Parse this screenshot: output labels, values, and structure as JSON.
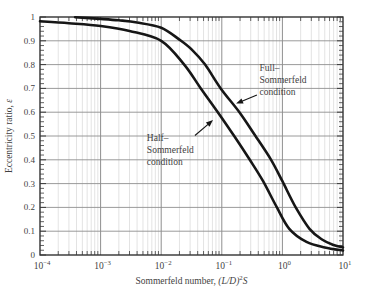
{
  "figure": {
    "background": "#ffffff",
    "frame_color": "#222222",
    "major_grid_color": "#8f8f8f",
    "minor_grid_color": "#c6c6c6",
    "tick_color": "#3a3a3a",
    "curve_color": "#161616",
    "text_color": "#3f3f3f"
  },
  "chart_data": {
    "type": "line",
    "title": "",
    "x_scale": "log",
    "xlim": [
      0.0001,
      10
    ],
    "ylim": [
      0,
      1
    ],
    "grid": {
      "vertical_minor": true,
      "vertical_major": true,
      "horizontal_major": true
    },
    "xlabel": {
      "prefix": "Sommerfeld number, ",
      "math": "(L/D)",
      "sup": "2",
      "suffix": "S"
    },
    "ylabel": {
      "prefix": "Eccentricity ratio, ",
      "math": "ε"
    },
    "x_ticks": [
      {
        "base": "10",
        "exp": "−4",
        "value": 0.0001
      },
      {
        "base": "10",
        "exp": "−3",
        "value": 0.001
      },
      {
        "base": "10",
        "exp": "−2",
        "value": 0.01
      },
      {
        "base": "10",
        "exp": "−1",
        "value": 0.1
      },
      {
        "base": "10",
        "exp": "0",
        "value": 1
      },
      {
        "base": "10",
        "exp": "1",
        "value": 10
      }
    ],
    "y_ticks": [
      {
        "label": "1",
        "value": 1.0
      },
      {
        "label": "0.9",
        "value": 0.9
      },
      {
        "label": "0.8",
        "value": 0.8
      },
      {
        "label": "0.7",
        "value": 0.7
      },
      {
        "label": "0.6",
        "value": 0.6
      },
      {
        "label": "0.5",
        "value": 0.5
      },
      {
        "label": "0.4",
        "value": 0.4
      },
      {
        "label": "0.3",
        "value": 0.3
      },
      {
        "label": "0.2",
        "value": 0.2
      },
      {
        "label": "0.1",
        "value": 0.1
      },
      {
        "label": "0",
        "value": 0.0
      }
    ],
    "y_minor_step": 0.02,
    "series": [
      {
        "name": "Full–Sommerfeld condition",
        "x": [
          0.00038,
          0.001,
          0.002,
          0.004,
          0.01,
          0.02,
          0.032,
          0.053,
          0.096,
          0.195,
          0.36,
          0.65,
          1.0,
          1.66,
          2.8,
          4.5,
          7.0,
          10.0
        ],
        "y": [
          0.999,
          0.992,
          0.986,
          0.977,
          0.955,
          0.905,
          0.863,
          0.8,
          0.7,
          0.6,
          0.5,
          0.4,
          0.31,
          0.2,
          0.11,
          0.065,
          0.042,
          0.032
        ]
      },
      {
        "name": "Half–Sommerfeld condition",
        "x": [
          0.0001,
          0.0003,
          0.001,
          0.003,
          0.01,
          0.024,
          0.045,
          0.086,
          0.16,
          0.29,
          0.48,
          0.81,
          1.3,
          2.5,
          5.0,
          10.0
        ],
        "y": [
          0.982,
          0.974,
          0.962,
          0.941,
          0.9,
          0.8,
          0.7,
          0.6,
          0.5,
          0.4,
          0.31,
          0.2,
          0.11,
          0.055,
          0.032,
          0.019
        ]
      }
    ],
    "annotations": [
      {
        "id": "full-sommerfeld-label",
        "lines": [
          "Full–",
          "Sommerfeld",
          "condition"
        ],
        "text_at": {
          "x": 0.42,
          "y": 0.805
        },
        "arrow": {
          "from": {
            "x": 0.38,
            "y": 0.672
          },
          "to": {
            "x": 0.172,
            "y": 0.636
          }
        }
      },
      {
        "id": "half-sommerfeld-label",
        "lines": [
          "Half–",
          "Sommerfeld",
          "condition"
        ],
        "text_at": {
          "x": 0.0058,
          "y": 0.512
        },
        "arrow": {
          "from": {
            "x": 0.036,
            "y": 0.502
          },
          "to": {
            "x": 0.0716,
            "y": 0.567
          }
        }
      }
    ]
  }
}
